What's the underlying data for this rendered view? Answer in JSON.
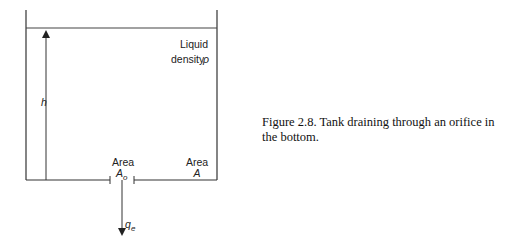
{
  "diagram": {
    "liquid_label_line1": "Liquid",
    "liquid_label_line2": "density",
    "density_symbol": "ρ",
    "height_label": "h",
    "orifice_area_label": "Area",
    "orifice_area_symbol": "A",
    "orifice_area_subscript": "o",
    "tank_area_label": "Area",
    "tank_area_symbol": "A",
    "flow_symbol": "q",
    "flow_subscript": "e"
  },
  "caption": {
    "text": "Figure 2.8. Tank draining through an orifice in the bottom."
  },
  "colors": {
    "line": "#333333",
    "text": "#111111"
  }
}
